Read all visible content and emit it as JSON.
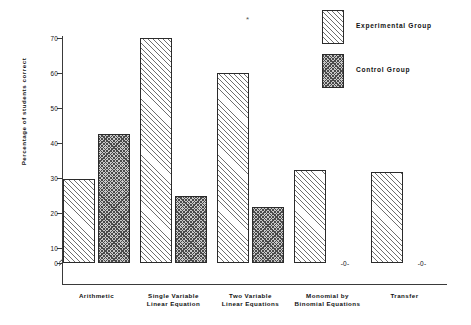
{
  "chart_data": {
    "type": "bar",
    "title": "",
    "xlabel": "",
    "ylabel": "Percentage of students correct",
    "ylim": [
      0,
      70
    ],
    "yticks": [
      0,
      10,
      20,
      30,
      40,
      50,
      60,
      70
    ],
    "ytick_labels": [
      "0",
      "10",
      "20",
      "30",
      "40",
      "50",
      "60",
      "70"
    ],
    "axis_break": true,
    "axis_break_between": [
      0,
      10
    ],
    "grid": false,
    "legend_position": "top-right",
    "categories": [
      "Arithmetic",
      "Single Variable Linear Equation",
      "Two Variable Linear Equations",
      "Monomial by Binomial Equations",
      "Transfer"
    ],
    "category_lines": [
      [
        "Arithmetic"
      ],
      [
        "Single  Variable",
        "Linear  Equation"
      ],
      [
        "Two  Variable",
        "Linear  Equations"
      ],
      [
        "Monomial  by",
        "Binomial  Equations"
      ],
      [
        "Transfer"
      ]
    ],
    "series": [
      {
        "name": "Experimental  Group",
        "values": [
          29.8,
          70.0,
          60.0,
          32.3,
          31.7
        ],
        "fill": "diagonal-hatch-light",
        "color": "#ffffff"
      },
      {
        "name": "Control  Group",
        "values": [
          42.7,
          25.0,
          21.7,
          0,
          0
        ],
        "fill": "crosshatch-dark",
        "color": "#c9c9c9"
      }
    ],
    "zero_markers": [
      {
        "series": "Control  Group",
        "category": "Monomial by Binomial Equations",
        "label": "-0-"
      },
      {
        "series": "Control  Group",
        "category": "Transfer",
        "label": "-0-"
      }
    ],
    "annotations": [
      {
        "text": "*",
        "near": "top-center"
      }
    ]
  },
  "legend": {
    "items": [
      {
        "label": "Experimental  Group",
        "swatch": "experimental-swatch"
      },
      {
        "label": "Control  Group",
        "swatch": "control-swatch"
      }
    ]
  },
  "colors": {
    "axis": "#3a3a3a",
    "bar_outline": "#2b2b2b",
    "experimental_fill": "#ffffff",
    "control_fill": "#c9c9c9",
    "text": "#111111"
  }
}
